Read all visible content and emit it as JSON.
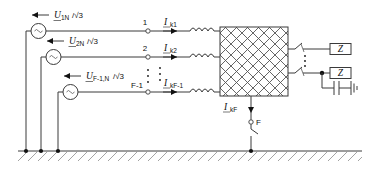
{
  "figure": {
    "type": "electrical-circuit-diagram"
  },
  "sources": [
    {
      "id": "source-1",
      "symbol": "ac-source",
      "label_main": "U",
      "label_sub": "1N",
      "label_tail": "/√3",
      "arrow_direction": "left"
    },
    {
      "id": "source-2",
      "symbol": "ac-source",
      "label_main": "U",
      "label_sub": "2N",
      "label_tail": "/√3",
      "arrow_direction": "left"
    },
    {
      "id": "source-f-1",
      "symbol": "ac-source",
      "label_main": "U",
      "label_sub": "F-1,N",
      "label_tail": "/√3",
      "arrow_direction": "left"
    }
  ],
  "nodes": [
    {
      "id": "node-1",
      "label": "1"
    },
    {
      "id": "node-2",
      "label": "2"
    },
    {
      "id": "node-f-1",
      "label": "F-1"
    },
    {
      "id": "node-f",
      "label": "F"
    }
  ],
  "currents": [
    {
      "id": "current-k1",
      "label_main": "I",
      "label_sub": "k1",
      "arrow_direction": "right"
    },
    {
      "id": "current-k2",
      "label_main": "I",
      "label_sub": "k2",
      "arrow_direction": "right"
    },
    {
      "id": "current-kf-1",
      "label_main": "I",
      "label_sub": "kF-1",
      "arrow_direction": "right"
    },
    {
      "id": "current-kf",
      "label_main": "I",
      "label_sub": "kF",
      "arrow_direction": "down"
    }
  ],
  "network_block": {
    "id": "network-block",
    "fill_pattern": "cross-hatch",
    "label": ""
  },
  "branch_elements": {
    "inductors": 3,
    "switches": 2,
    "load_boxes": 2,
    "capacitor": 1,
    "ground_symbols": 2
  },
  "vertical_ellipsis": [
    {
      "id": "ellipsis-source-column"
    },
    {
      "id": "ellipsis-node-column"
    },
    {
      "id": "ellipsis-switch-column"
    }
  ],
  "ground": {
    "id": "earth-rail",
    "style": "hatched",
    "connection_dots": 4
  },
  "fault": {
    "id": "fault-switch",
    "node_label": "F",
    "current_label_main": "I",
    "current_label_sub": "kF"
  },
  "colors": {
    "wire": "#3a3a3a",
    "hatch": "#9a9a9a",
    "text": "#111111",
    "background": "#ffffff"
  }
}
